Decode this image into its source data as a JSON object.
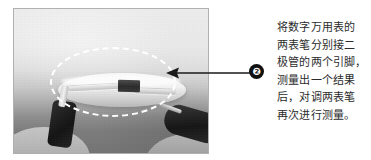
{
  "figure": {
    "alt_name": "digital-multimeter-diode-test-photo",
    "highlight_shape": "dashed-ellipse",
    "highlight_color": "#ffffff"
  },
  "callout": {
    "badge_number": "❷",
    "badge_color": "#111111",
    "badge_text_color": "#ffffff",
    "arrow_color": "#1a1a1a",
    "arrow_direction": "left"
  },
  "caption": {
    "full_text": "将数字万用表的两表笔分别接二极管的两个引脚，测量出一个结果后，对调两表笔再次进行测量。",
    "lines": [
      "将数字万用表的",
      "两表笔分别接二",
      "极管的两个引脚，",
      "测量出一个结果",
      "后，对调两表笔",
      "再次进行测量。"
    ],
    "text_color": "#2b2b2b"
  },
  "photo_elements": {
    "diode_label": "diode-body",
    "left_probe_label": "left-test-probe",
    "right_probe_label": "right-test-probe",
    "left_hand_label": "left-hand",
    "right_hand_label": "right-hand"
  }
}
